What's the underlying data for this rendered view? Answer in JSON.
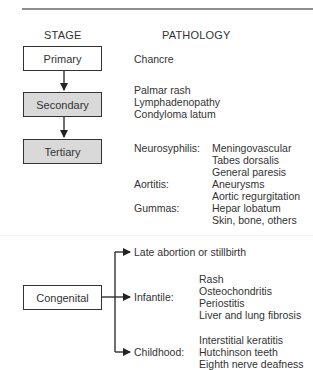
{
  "headers": {
    "stage": "STAGE",
    "pathology": "PATHOLOGY"
  },
  "stages": [
    {
      "label": "Primary",
      "fill": "#ffffff",
      "pathology": [
        "Chancre"
      ]
    },
    {
      "label": "Secondary",
      "fill": "#d9d9d9",
      "pathology": [
        "Palmar rash",
        "Lymphadenopathy",
        "Condyloma latum"
      ]
    },
    {
      "label": "Tertiary",
      "fill": "#d9d9d9",
      "groups": [
        {
          "label": "Neurosyphilis:",
          "items": [
            "Meningovascular",
            "Tabes dorsalis",
            "General paresis"
          ]
        },
        {
          "label": "Aortitis:",
          "items": [
            "Aneurysms",
            "Aortic regurgitation"
          ]
        },
        {
          "label": "Gummas:",
          "items": [
            "Hepar lobatum",
            "Skin, bone, others"
          ]
        }
      ]
    }
  ],
  "congenital": {
    "label": "Congenital",
    "branches": [
      {
        "label": "Late abortion or stillbirth",
        "items": []
      },
      {
        "label": "Infantile:",
        "items": [
          "Rash",
          "Osteochondritis",
          "Periostitis",
          "Liver and lung fibrosis"
        ]
      },
      {
        "label": "Childhood:",
        "items": [
          "Interstitial keratitis",
          "Hutchinson teeth",
          "Eighth nerve deafness"
        ]
      }
    ]
  }
}
